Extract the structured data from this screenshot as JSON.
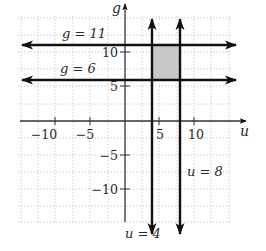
{
  "figure": {
    "type": "coordinate-plane",
    "axes": {
      "horizontal_label": "u",
      "vertical_label": "g",
      "horizontal_ticks": [
        {
          "value": -10,
          "label": "−10"
        },
        {
          "value": -5,
          "label": "−5"
        },
        {
          "value": 5,
          "label": "5"
        },
        {
          "value": 10,
          "label": "10"
        }
      ],
      "vertical_ticks": [
        {
          "value": 10,
          "label": "10"
        },
        {
          "value": 5,
          "label": "5"
        },
        {
          "value": -5,
          "label": "−5"
        },
        {
          "value": -10,
          "label": "−10"
        }
      ],
      "grid": "dotted"
    },
    "lines": [
      {
        "equation": "g = 11",
        "orientation": "horizontal",
        "value": 11
      },
      {
        "equation": "g = 6",
        "orientation": "horizontal",
        "value": 6
      },
      {
        "equation": "u = 4",
        "orientation": "vertical",
        "value": 4
      },
      {
        "equation": "u = 8",
        "orientation": "vertical",
        "value": 8
      }
    ],
    "shaded_region": {
      "u_range": [
        4,
        8
      ],
      "g_range": [
        6,
        11
      ],
      "color": "#c8c8c8"
    },
    "labels": {
      "g11": "g = 11",
      "g6": "g = 6",
      "u4": "u = 4",
      "u8": "u = 8",
      "u_axis": "u",
      "g_axis": "g",
      "tick_u_m10": "−10",
      "tick_u_m5": "−5",
      "tick_u_5": "5",
      "tick_u_10": "10",
      "tick_g_10": "10",
      "tick_g_5": "5",
      "tick_g_m5": "−5",
      "tick_g_m10": "−10"
    },
    "colors": {
      "line": "#111111",
      "grid": "#b0b0b0",
      "shade": "#c8c8c8"
    }
  }
}
